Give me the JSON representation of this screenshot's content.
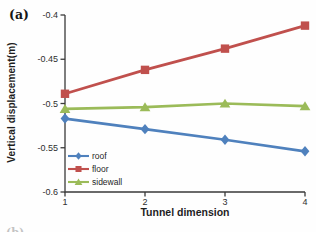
{
  "figure_label": "(a)",
  "corner_artifact": "(b)",
  "chart_data": {
    "type": "line",
    "title": "",
    "xlabel": "Tunnel dimension",
    "ylabel": "Vertical displacement(m)",
    "x": [
      1,
      2,
      3,
      4
    ],
    "x_ticks": [
      "1",
      "2",
      "3",
      "4"
    ],
    "y_ticks": [
      -0.4,
      -0.45,
      -0.5,
      -0.55,
      -0.6
    ],
    "y_tick_labels": [
      "-0.4",
      "-0.45",
      "-0.5",
      "-0.55",
      "-0.6"
    ],
    "xlim": [
      1,
      4
    ],
    "ylim": [
      -0.6,
      -0.4
    ],
    "grid": false,
    "legend_position": "inside-bottom-left",
    "axis_color": "#3a3a3a",
    "text_color": "#2e2e2e",
    "series": [
      {
        "name": "roof",
        "marker": "diamond",
        "color": "#4F81BD",
        "values": [
          -0.517,
          -0.529,
          -0.541,
          -0.554
        ]
      },
      {
        "name": "floor",
        "marker": "square",
        "color": "#C0504D",
        "values": [
          -0.489,
          -0.462,
          -0.438,
          -0.412
        ]
      },
      {
        "name": "sidewall",
        "marker": "triangle",
        "color": "#9BBB59",
        "values": [
          -0.506,
          -0.504,
          -0.5,
          -0.503
        ]
      }
    ]
  }
}
